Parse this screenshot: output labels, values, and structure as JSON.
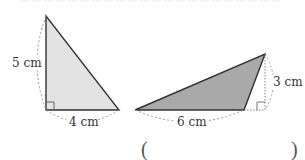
{
  "figure": {
    "left_triangle": {
      "height_label": "5 cm",
      "base_label": "4 cm",
      "fill": "#e3e3e3",
      "stroke": "#333333",
      "vertices": [
        [
          46,
          16
        ],
        [
          46,
          110
        ],
        [
          119,
          110
        ]
      ],
      "right_angle": true
    },
    "right_triangle": {
      "base_label": "6 cm",
      "height_label": "3 cm",
      "fill": "#a9a9a9",
      "stroke": "#333333",
      "vertices": [
        [
          135,
          110
        ],
        [
          244,
          110
        ],
        [
          265,
          54
        ]
      ],
      "right_angle": true
    },
    "answer_blank": {
      "open": "(",
      "close": ")"
    },
    "colors": {
      "dashed_arc": "#999999",
      "label": "#333333"
    }
  }
}
